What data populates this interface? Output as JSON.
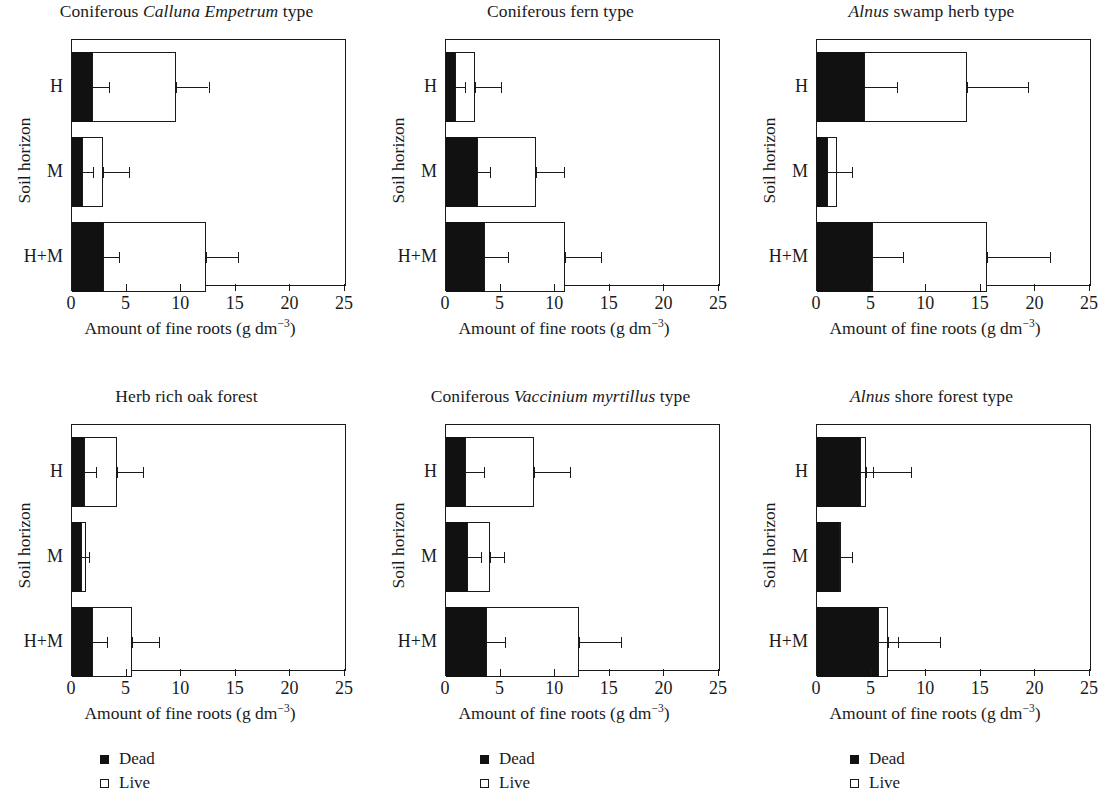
{
  "figure": {
    "xaxis_label_text": "Amount of fine roots (g dm",
    "xaxis_label_sup": "−3",
    "xaxis_label_tail": ")",
    "yaxis_label": "Soil horizon",
    "categories": [
      "H",
      "M",
      "H+M"
    ],
    "xticks": [
      0,
      5,
      10,
      15,
      20,
      25
    ],
    "xtick_labels": [
      "0",
      "5",
      "10",
      "15",
      "20",
      "25"
    ],
    "xlim": [
      0,
      25
    ]
  },
  "legend": {
    "dead_label": "Dead",
    "live_label": "Live",
    "dead_color": "#111111",
    "live_color": "#ffffff"
  },
  "chart_data": {
    "type": "bar",
    "xlabel": "Amount of fine roots (g dm^-3)",
    "ylabel": "Soil horizon",
    "xlim": [
      0,
      25
    ],
    "grid": false,
    "legend_position": "below-left",
    "orientation": "horizontal",
    "stacked": true,
    "categories": [
      "H",
      "M",
      "H+M"
    ],
    "series_names": [
      "Dead",
      "Live"
    ],
    "panels": [
      {
        "id": "coniferous-calluna-empetrum",
        "title_pre": "Coniferous ",
        "title_italic": "Calluna Empetrum",
        "title_post": " type",
        "rows": [
          {
            "category": "H",
            "dead": 1.8,
            "live": 7.7,
            "total": 9.5,
            "dead_err_hi": 3.4,
            "total_err_hi": 12.5
          },
          {
            "category": "M",
            "dead": 0.9,
            "live": 1.9,
            "total": 2.8,
            "dead_err_hi": 1.9,
            "total_err_hi": 5.2
          },
          {
            "category": "H+M",
            "dead": 2.8,
            "live": 9.5,
            "total": 12.3,
            "dead_err_hi": 4.3,
            "total_err_hi": 15.2
          }
        ]
      },
      {
        "id": "coniferous-fern",
        "title_pre": "Coniferous fern type",
        "title_italic": "",
        "title_post": "",
        "rows": [
          {
            "category": "H",
            "dead": 0.8,
            "live": 1.9,
            "total": 2.7,
            "dead_err_hi": 1.7,
            "total_err_hi": 5.0
          },
          {
            "category": "M",
            "dead": 2.8,
            "live": 5.4,
            "total": 8.2,
            "dead_err_hi": 4.0,
            "total_err_hi": 10.8
          },
          {
            "category": "H+M",
            "dead": 3.5,
            "live": 7.4,
            "total": 10.9,
            "dead_err_hi": 5.7,
            "total_err_hi": 14.2
          }
        ]
      },
      {
        "id": "alnus-swamp-herb",
        "title_pre": "",
        "title_italic": "Alnus",
        "title_post": " swamp herb type",
        "rows": [
          {
            "category": "H",
            "dead": 4.3,
            "live": 9.4,
            "total": 13.7,
            "dead_err_hi": 7.3,
            "total_err_hi": 19.3
          },
          {
            "category": "M",
            "dead": 0.9,
            "live": 0.9,
            "total": 1.8,
            "dead_err_hi": 3.2,
            "total_err_hi": null
          },
          {
            "category": "H+M",
            "dead": 5.0,
            "live": 10.6,
            "total": 15.6,
            "dead_err_hi": 7.9,
            "total_err_hi": 21.3
          }
        ]
      },
      {
        "id": "herb-rich-oak-forest",
        "title_pre": "Herb rich oak forest",
        "title_italic": "",
        "title_post": "",
        "rows": [
          {
            "category": "H",
            "dead": 1.1,
            "live": 3.0,
            "total": 4.1,
            "dead_err_hi": 2.2,
            "total_err_hi": 6.5
          },
          {
            "category": "M",
            "dead": 0.8,
            "live": 0.5,
            "total": 1.3,
            "dead_err_hi": 1.6,
            "total_err_hi": null
          },
          {
            "category": "H+M",
            "dead": 1.8,
            "live": 3.7,
            "total": 5.5,
            "dead_err_hi": 3.2,
            "total_err_hi": 8.0
          }
        ]
      },
      {
        "id": "coniferous-vaccinium-myrtillus",
        "title_pre": "Coniferous ",
        "title_italic": "Vaccinium myrtillus",
        "title_post": " type",
        "rows": [
          {
            "category": "H",
            "dead": 1.7,
            "live": 6.4,
            "total": 8.1,
            "dead_err_hi": 3.5,
            "total_err_hi": 11.4
          },
          {
            "category": "M",
            "dead": 1.9,
            "live": 2.1,
            "total": 4.0,
            "dead_err_hi": 3.2,
            "total_err_hi": 5.3
          },
          {
            "category": "H+M",
            "dead": 3.7,
            "live": 8.5,
            "total": 12.2,
            "dead_err_hi": 5.4,
            "total_err_hi": 16.0
          }
        ]
      },
      {
        "id": "alnus-shore-forest",
        "title_pre": "",
        "title_italic": "Alnus",
        "title_post": " shore forest type",
        "rows": [
          {
            "category": "H",
            "dead": 3.9,
            "live": 0.6,
            "total": 4.5,
            "dead_err_hi": 5.1,
            "total_err_hi": 8.6
          },
          {
            "category": "M",
            "dead": 2.0,
            "live": 0.1,
            "total": 2.1,
            "dead_err_hi": 3.2,
            "total_err_hi": null
          },
          {
            "category": "H+M",
            "dead": 5.6,
            "live": 0.9,
            "total": 6.5,
            "dead_err_hi": 7.4,
            "total_err_hi": 11.3
          }
        ]
      }
    ]
  }
}
